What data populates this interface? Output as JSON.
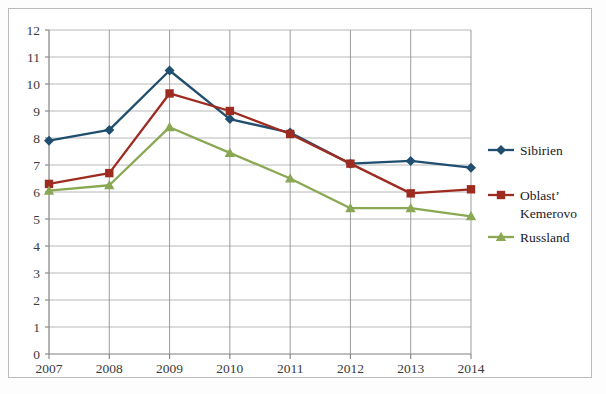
{
  "chart_data": {
    "type": "line",
    "title": "",
    "subtitle": "",
    "xlabel": "",
    "ylabel": "",
    "categories": [
      "2007",
      "2008",
      "2009",
      "2010",
      "2011",
      "2012",
      "2013",
      "2014"
    ],
    "ylim": [
      0,
      12
    ],
    "ytick_step": 1,
    "yticks": [
      "12",
      "11",
      "10",
      "9",
      "8",
      "7",
      "6",
      "5",
      "4",
      "3",
      "2",
      "1",
      "0"
    ],
    "grid": "horizontal-and-vertical",
    "legend_position": "right",
    "series": [
      {
        "name": "Sibirien",
        "color": "#1f4e6e",
        "marker": "diamond",
        "values": [
          7.9,
          8.3,
          10.5,
          8.7,
          8.2,
          7.05,
          7.15,
          6.9
        ]
      },
      {
        "name": "Oblast’ Kemerovo",
        "color": "#9e2b20",
        "marker": "square",
        "values": [
          6.3,
          6.7,
          9.65,
          9.0,
          8.15,
          7.05,
          5.95,
          6.1
        ]
      },
      {
        "name": "Russland",
        "color": "#8aa853",
        "marker": "triangle",
        "values": [
          6.05,
          6.25,
          8.4,
          7.45,
          6.5,
          5.4,
          5.4,
          5.1
        ]
      }
    ],
    "legend_entries": [
      {
        "label": "Sibirien",
        "label_lines": [
          "Sibirien"
        ],
        "color": "#1f4e6e",
        "marker": "diamond"
      },
      {
        "label": "Oblast’ Kemerovo",
        "label_lines": [
          "Oblast’",
          "Kemerovo"
        ],
        "color": "#9e2b20",
        "marker": "square"
      },
      {
        "label": "Russland",
        "label_lines": [
          "Russland"
        ],
        "color": "#8aa853",
        "marker": "triangle"
      }
    ]
  }
}
